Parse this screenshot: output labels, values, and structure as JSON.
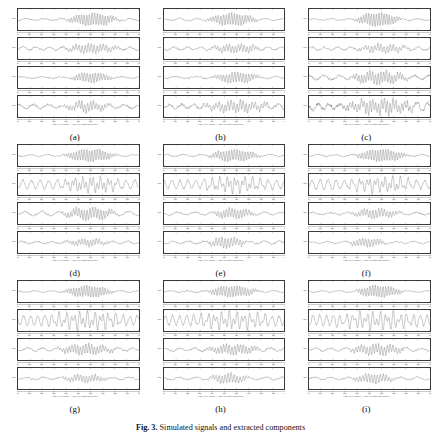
{
  "figure": {
    "caption_prefix": "Fig. 3.",
    "caption_text": "Simulated signals and extracted components",
    "caption_visible": "partially-cropped",
    "columns": 3,
    "rows": 3,
    "subplots_per_panel": 4
  },
  "axis": {
    "x_label": "Time in seconds / Time in sampling points",
    "y_label": "Amp.",
    "x_tick_labels": [
      "0",
      "0.1",
      "0.2",
      "0.3",
      "0.4",
      "0.5",
      "0.6",
      "0.7",
      "0.8",
      "0.9",
      "1.0"
    ],
    "x_range": [
      0,
      1
    ],
    "y_range": [
      -1,
      1
    ],
    "grid": false,
    "tick_count": 11
  },
  "panels": [
    {
      "label": "(a)",
      "name": "panel-a",
      "chart_data": {
        "type": "line",
        "title": "(a)",
        "xlabel": "Time in seconds / Time in sampling points",
        "ylabel": "Amp.",
        "xlim": [
          0,
          1
        ],
        "ylim": [
          -1,
          1
        ],
        "grid": false,
        "series": [
          {
            "name": "signal-1",
            "seed": 11,
            "noise": 0.12,
            "burst_start": 0.38,
            "burst_end": 0.86,
            "burst_amp": 0.62,
            "burst_freq": 46,
            "base_freq": 7,
            "base_amp": 0.1
          },
          {
            "name": "signal-2",
            "seed": 12,
            "noise": 0.14,
            "burst_start": 0.34,
            "burst_end": 0.88,
            "burst_amp": 0.42,
            "burst_freq": 40,
            "base_freq": 9,
            "base_amp": 0.16
          },
          {
            "name": "signal-3",
            "seed": 13,
            "noise": 0.1,
            "burst_start": 0.42,
            "burst_end": 0.8,
            "burst_amp": 0.5,
            "burst_freq": 44,
            "base_freq": 6,
            "base_amp": 0.08
          },
          {
            "name": "signal-4",
            "seed": 14,
            "noise": 0.2,
            "burst_start": 0.36,
            "burst_end": 0.78,
            "burst_amp": 0.45,
            "burst_freq": 42,
            "base_freq": 8,
            "base_amp": 0.18
          }
        ]
      }
    },
    {
      "label": "(b)",
      "name": "panel-b",
      "chart_data": {
        "type": "line",
        "title": "(b)",
        "xlabel": "Time in seconds / Time in sampling points",
        "ylabel": "Amp.",
        "xlim": [
          0,
          1
        ],
        "ylim": [
          -1,
          1
        ],
        "grid": false,
        "series": [
          {
            "name": "signal-1",
            "seed": 21,
            "noise": 0.1,
            "burst_start": 0.34,
            "burst_end": 0.8,
            "burst_amp": 0.6,
            "burst_freq": 45,
            "base_freq": 7,
            "base_amp": 0.09
          },
          {
            "name": "signal-2",
            "seed": 22,
            "noise": 0.13,
            "burst_start": 0.36,
            "burst_end": 0.84,
            "burst_amp": 0.4,
            "burst_freq": 41,
            "base_freq": 9,
            "base_amp": 0.15
          },
          {
            "name": "signal-3",
            "seed": 23,
            "noise": 0.12,
            "burst_start": 0.4,
            "burst_end": 0.82,
            "burst_amp": 0.52,
            "burst_freq": 43,
            "base_freq": 6,
            "base_amp": 0.1
          },
          {
            "name": "signal-4",
            "seed": 24,
            "noise": 0.26,
            "burst_start": 0.3,
            "burst_end": 0.9,
            "burst_amp": 0.5,
            "burst_freq": 40,
            "base_freq": 10,
            "base_amp": 0.22
          }
        ]
      }
    },
    {
      "label": "(c)",
      "name": "panel-c",
      "chart_data": {
        "type": "line",
        "title": "(c)",
        "xlabel": "Time in seconds / Time in sampling points",
        "ylabel": "Amp.",
        "xlim": [
          0,
          1
        ],
        "ylim": [
          -1,
          1
        ],
        "grid": false,
        "series": [
          {
            "name": "signal-1",
            "seed": 31,
            "noise": 0.09,
            "burst_start": 0.36,
            "burst_end": 0.78,
            "burst_amp": 0.66,
            "burst_freq": 47,
            "base_freq": 7,
            "base_amp": 0.08
          },
          {
            "name": "signal-2",
            "seed": 32,
            "noise": 0.14,
            "burst_start": 0.38,
            "burst_end": 0.86,
            "burst_amp": 0.38,
            "burst_freq": 39,
            "base_freq": 9,
            "base_amp": 0.17
          },
          {
            "name": "signal-3",
            "seed": 33,
            "noise": 0.2,
            "burst_start": 0.3,
            "burst_end": 0.88,
            "burst_amp": 0.58,
            "burst_freq": 44,
            "base_freq": 8,
            "base_amp": 0.2
          },
          {
            "name": "signal-4",
            "seed": 34,
            "noise": 0.34,
            "burst_start": 0.24,
            "burst_end": 0.92,
            "burst_amp": 0.62,
            "burst_freq": 42,
            "base_freq": 11,
            "base_amp": 0.28
          }
        ]
      }
    },
    {
      "label": "(d)",
      "name": "panel-d",
      "chart_data": {
        "type": "line",
        "title": "(d)",
        "xlabel": "Time in seconds / Time in sampling points",
        "ylabel": "Amp.",
        "xlim": [
          0,
          1
        ],
        "ylim": [
          -1,
          1
        ],
        "grid": false,
        "series": [
          {
            "name": "signal-1",
            "seed": 41,
            "noise": 0.1,
            "burst_start": 0.36,
            "burst_end": 0.84,
            "burst_amp": 0.6,
            "burst_freq": 46,
            "base_freq": 7,
            "base_amp": 0.09
          },
          {
            "name": "signal-2",
            "seed": 42,
            "noise": 0.16,
            "burst_start": 0.3,
            "burst_end": 0.9,
            "burst_amp": 0.55,
            "burst_freq": 34,
            "base_freq": 14,
            "base_amp": 0.42
          },
          {
            "name": "signal-3",
            "seed": 43,
            "noise": 0.14,
            "burst_start": 0.34,
            "burst_end": 0.86,
            "burst_amp": 0.56,
            "burst_freq": 44,
            "base_freq": 7,
            "base_amp": 0.2
          },
          {
            "name": "signal-4",
            "seed": 44,
            "noise": 0.12,
            "burst_start": 0.36,
            "burst_end": 0.8,
            "burst_amp": 0.34,
            "burst_freq": 42,
            "base_freq": 8,
            "base_amp": 0.12
          }
        ]
      }
    },
    {
      "label": "(e)",
      "name": "panel-e",
      "chart_data": {
        "type": "line",
        "title": "(e)",
        "xlabel": "Time in seconds / Time in sampling points",
        "ylabel": "Amp.",
        "xlim": [
          0,
          1
        ],
        "ylim": [
          -1,
          1
        ],
        "grid": false,
        "series": [
          {
            "name": "signal-1",
            "seed": 51,
            "noise": 0.1,
            "burst_start": 0.34,
            "burst_end": 0.82,
            "burst_amp": 0.58,
            "burst_freq": 45,
            "base_freq": 7,
            "base_amp": 0.1
          },
          {
            "name": "signal-2",
            "seed": 52,
            "noise": 0.18,
            "burst_start": 0.28,
            "burst_end": 0.92,
            "burst_amp": 0.5,
            "burst_freq": 33,
            "base_freq": 15,
            "base_amp": 0.44
          },
          {
            "name": "signal-3",
            "seed": 53,
            "noise": 0.12,
            "burst_start": 0.38,
            "burst_end": 0.78,
            "burst_amp": 0.48,
            "burst_freq": 43,
            "base_freq": 7,
            "base_amp": 0.14
          },
          {
            "name": "signal-4",
            "seed": 54,
            "noise": 0.14,
            "burst_start": 0.34,
            "burst_end": 0.7,
            "burst_amp": 0.52,
            "burst_freq": 40,
            "base_freq": 8,
            "base_amp": 0.14
          }
        ]
      }
    },
    {
      "label": "(f)",
      "name": "panel-f",
      "chart_data": {
        "type": "line",
        "title": "(f)",
        "xlabel": "Time in seconds / Time in sampling points",
        "ylabel": "Amp.",
        "xlim": [
          0,
          1
        ],
        "ylim": [
          -1,
          1
        ],
        "grid": false,
        "series": [
          {
            "name": "signal-1",
            "seed": 61,
            "noise": 0.1,
            "burst_start": 0.36,
            "burst_end": 0.84,
            "burst_amp": 0.6,
            "burst_freq": 46,
            "base_freq": 7,
            "base_amp": 0.09
          },
          {
            "name": "signal-2",
            "seed": 62,
            "noise": 0.18,
            "burst_start": 0.26,
            "burst_end": 0.94,
            "burst_amp": 0.48,
            "burst_freq": 32,
            "base_freq": 15,
            "base_amp": 0.46
          },
          {
            "name": "signal-3",
            "seed": 63,
            "noise": 0.12,
            "burst_start": 0.32,
            "burst_end": 0.8,
            "burst_amp": 0.44,
            "burst_freq": 42,
            "base_freq": 7,
            "base_amp": 0.13
          },
          {
            "name": "signal-4",
            "seed": 64,
            "noise": 0.1,
            "burst_start": 0.3,
            "burst_end": 0.66,
            "burst_amp": 0.4,
            "burst_freq": 41,
            "base_freq": 7,
            "base_amp": 0.1
          }
        ]
      }
    },
    {
      "label": "(g)",
      "name": "panel-g",
      "chart_data": {
        "type": "line",
        "title": "(g)",
        "xlabel": "Time in seconds / Time in sampling points",
        "ylabel": "Amp.",
        "xlim": [
          0,
          1
        ],
        "ylim": [
          -1,
          1
        ],
        "grid": false,
        "series": [
          {
            "name": "signal-1",
            "seed": 71,
            "noise": 0.09,
            "burst_start": 0.36,
            "burst_end": 0.82,
            "burst_amp": 0.58,
            "burst_freq": 46,
            "base_freq": 7,
            "base_amp": 0.08
          },
          {
            "name": "signal-2",
            "seed": 72,
            "noise": 0.16,
            "burst_start": 0.2,
            "burst_end": 0.95,
            "burst_amp": 0.6,
            "burst_freq": 30,
            "base_freq": 17,
            "base_amp": 0.5
          },
          {
            "name": "signal-3",
            "seed": 73,
            "noise": 0.14,
            "burst_start": 0.3,
            "burst_end": 0.84,
            "burst_amp": 0.5,
            "burst_freq": 43,
            "base_freq": 8,
            "base_amp": 0.16
          },
          {
            "name": "signal-4",
            "seed": 74,
            "noise": 0.12,
            "burst_start": 0.34,
            "burst_end": 0.78,
            "burst_amp": 0.36,
            "burst_freq": 41,
            "base_freq": 7,
            "base_amp": 0.12
          }
        ]
      }
    },
    {
      "label": "(h)",
      "name": "panel-h",
      "chart_data": {
        "type": "line",
        "title": "(h)",
        "xlabel": "Time in seconds / Time in sampling points",
        "ylabel": "Amp.",
        "xlim": [
          0,
          1
        ],
        "ylim": [
          -1,
          1
        ],
        "grid": false,
        "series": [
          {
            "name": "signal-1",
            "seed": 81,
            "noise": 0.1,
            "burst_start": 0.34,
            "burst_end": 0.8,
            "burst_amp": 0.56,
            "burst_freq": 45,
            "base_freq": 7,
            "base_amp": 0.09
          },
          {
            "name": "signal-2",
            "seed": 82,
            "noise": 0.16,
            "burst_start": 0.2,
            "burst_end": 0.95,
            "burst_amp": 0.58,
            "burst_freq": 30,
            "base_freq": 17,
            "base_amp": 0.5
          },
          {
            "name": "signal-3",
            "seed": 83,
            "noise": 0.14,
            "burst_start": 0.32,
            "burst_end": 0.82,
            "burst_amp": 0.48,
            "burst_freq": 43,
            "base_freq": 8,
            "base_amp": 0.15
          },
          {
            "name": "signal-4",
            "seed": 84,
            "noise": 0.12,
            "burst_start": 0.36,
            "burst_end": 0.72,
            "burst_amp": 0.46,
            "burst_freq": 40,
            "base_freq": 7,
            "base_amp": 0.12
          }
        ]
      }
    },
    {
      "label": "(i)",
      "name": "panel-i",
      "chart_data": {
        "type": "line",
        "title": "(i)",
        "xlabel": "Time in seconds / Time in sampling points",
        "ylabel": "Amp.",
        "xlim": [
          0,
          1
        ],
        "ylim": [
          -1,
          1
        ],
        "grid": false,
        "series": [
          {
            "name": "signal-1",
            "seed": 91,
            "noise": 0.09,
            "burst_start": 0.36,
            "burst_end": 0.8,
            "burst_amp": 0.58,
            "burst_freq": 46,
            "base_freq": 7,
            "base_amp": 0.08
          },
          {
            "name": "signal-2",
            "seed": 92,
            "noise": 0.16,
            "burst_start": 0.18,
            "burst_end": 0.96,
            "burst_amp": 0.6,
            "burst_freq": 29,
            "base_freq": 18,
            "base_amp": 0.52
          },
          {
            "name": "signal-3",
            "seed": 93,
            "noise": 0.14,
            "burst_start": 0.3,
            "burst_end": 0.84,
            "burst_amp": 0.5,
            "burst_freq": 42,
            "base_freq": 8,
            "base_amp": 0.16
          },
          {
            "name": "signal-4",
            "seed": 94,
            "noise": 0.12,
            "burst_start": 0.34,
            "burst_end": 0.74,
            "burst_amp": 0.44,
            "burst_freq": 41,
            "base_freq": 7,
            "base_amp": 0.12
          }
        ]
      }
    }
  ]
}
